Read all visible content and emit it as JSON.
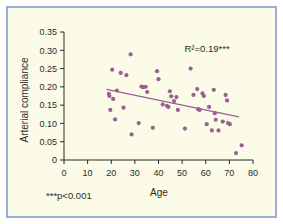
{
  "figure": {
    "border_color": "#9aadd8",
    "background_color": "#fbfbe8",
    "point_color": "#9b5f96",
    "line_color": "#9b5f96",
    "axis_color": "#2b2b2b"
  },
  "annotations": {
    "r_squared": "R²=0.19***",
    "footnote": "***p<0.001"
  },
  "chart_data": {
    "type": "scatter",
    "title": "",
    "xlabel": "Age",
    "ylabel": "Arterial compliance",
    "xlim": [
      0,
      80
    ],
    "ylim": [
      0,
      0.35
    ],
    "grid": false,
    "legend": "none",
    "xticks": [
      0,
      10,
      20,
      30,
      40,
      50,
      60,
      70,
      80
    ],
    "xticklabels": [
      "0",
      "10",
      "20",
      "30",
      "40",
      "50",
      "60",
      "70",
      "80"
    ],
    "yticks": [
      0,
      0.05,
      0.1,
      0.15,
      0.2,
      0.25,
      0.3,
      0.35
    ],
    "yticklabels": [
      "0",
      "0.05",
      "0.10",
      "0.15",
      "0.20",
      "0.25",
      "0.30",
      "0.35"
    ],
    "points": [
      [
        19.0,
        0.181
      ],
      [
        19.2,
        0.175
      ],
      [
        19.6,
        0.137
      ],
      [
        20.4,
        0.247
      ],
      [
        20.8,
        0.167
      ],
      [
        21.6,
        0.111
      ],
      [
        22.4,
        0.19
      ],
      [
        24.0,
        0.238
      ],
      [
        25.2,
        0.143
      ],
      [
        26.4,
        0.232
      ],
      [
        28.2,
        0.289
      ],
      [
        28.6,
        0.07
      ],
      [
        31.6,
        0.101
      ],
      [
        32.8,
        0.201
      ],
      [
        33.4,
        0.199
      ],
      [
        34.6,
        0.2
      ],
      [
        35.2,
        0.186
      ],
      [
        37.6,
        0.088
      ],
      [
        39.4,
        0.243
      ],
      [
        40.0,
        0.221
      ],
      [
        41.8,
        0.152
      ],
      [
        43.6,
        0.148
      ],
      [
        44.2,
        0.145
      ],
      [
        44.8,
        0.188
      ],
      [
        45.4,
        0.174
      ],
      [
        46.6,
        0.161
      ],
      [
        47.6,
        0.172
      ],
      [
        48.2,
        0.137
      ],
      [
        51.2,
        0.086
      ],
      [
        53.6,
        0.25
      ],
      [
        54.8,
        0.178
      ],
      [
        56.4,
        0.194
      ],
      [
        56.8,
        0.139
      ],
      [
        57.4,
        0.137
      ],
      [
        58.6,
        0.182
      ],
      [
        59.2,
        0.175
      ],
      [
        60.4,
        0.098
      ],
      [
        61.4,
        0.145
      ],
      [
        62.6,
        0.081
      ],
      [
        63.4,
        0.192
      ],
      [
        63.8,
        0.128
      ],
      [
        64.2,
        0.11
      ],
      [
        65.4,
        0.081
      ],
      [
        67.2,
        0.105
      ],
      [
        68.4,
        0.178
      ],
      [
        69.0,
        0.163
      ],
      [
        69.4,
        0.101
      ],
      [
        70.2,
        0.098
      ],
      [
        72.8,
        0.019
      ],
      [
        75.2,
        0.04
      ]
    ],
    "trendline": {
      "x": [
        18.0,
        74.0
      ],
      "y": [
        0.193,
        0.118
      ]
    }
  }
}
